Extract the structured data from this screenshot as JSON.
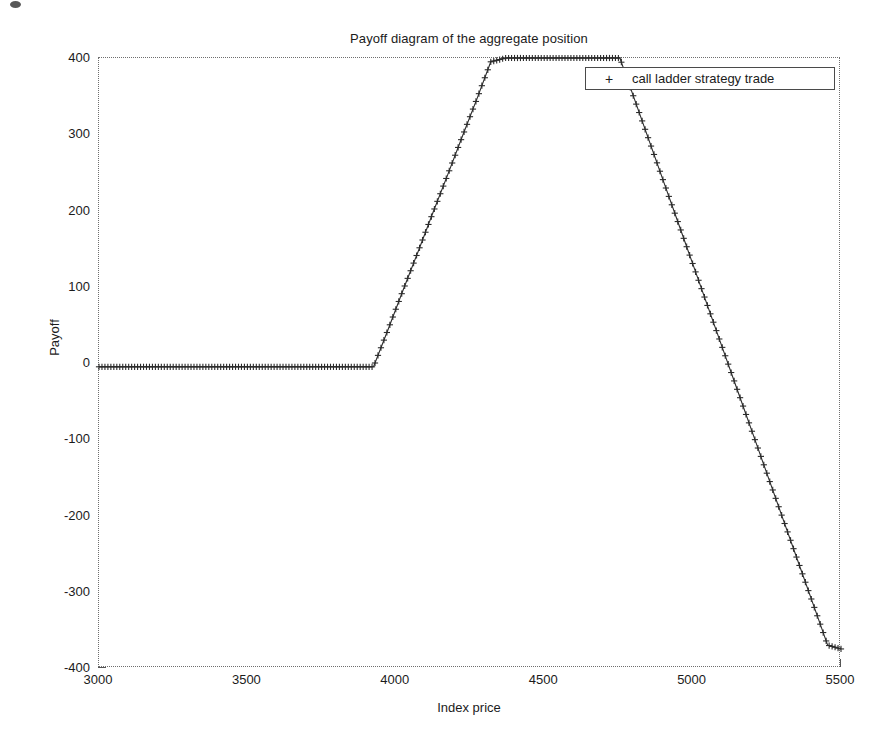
{
  "figure": {
    "title": "Payoff diagram of the aggregate position",
    "background_color": "#ffffff",
    "axis_color": "#6e6e6e",
    "data_color": "#2b2b2b"
  },
  "legend": {
    "marker": "+",
    "label": "call ladder strategy trade",
    "position": "top-right-inside"
  },
  "chart_data": {
    "type": "line",
    "title": "Payoff diagram of the aggregate position",
    "xlabel": "Index price",
    "ylabel": "Payoff",
    "xlim": [
      3000,
      5500
    ],
    "ylim": [
      -400,
      400
    ],
    "xticks": [
      3000,
      3500,
      4000,
      4500,
      5000,
      5500
    ],
    "xtick_labels": [
      "3000",
      "3500",
      "4000",
      "4500",
      "5000",
      "5500"
    ],
    "yticks": [
      -400,
      -300,
      -200,
      -100,
      0,
      100,
      200,
      300,
      400
    ],
    "ytick_labels": [
      "-400",
      "-300",
      "-200",
      "-100",
      "0",
      "100",
      "200",
      "300",
      "400"
    ],
    "grid": false,
    "legend_position": "upper right",
    "marker": "+",
    "linestyle": "-",
    "series": [
      {
        "name": "call ladder strategy trade",
        "color": "#2b2b2b",
        "x": [
          3000,
          3050,
          3100,
          3150,
          3200,
          3250,
          3300,
          3350,
          3400,
          3450,
          3500,
          3550,
          3600,
          3650,
          3700,
          3750,
          3800,
          3850,
          3900,
          3925,
          3975,
          4025,
          4075,
          4125,
          4175,
          4225,
          4275,
          4320,
          4370,
          4420,
          4470,
          4520,
          4570,
          4620,
          4670,
          4720,
          4755,
          4805,
          4855,
          4905,
          4955,
          5005,
          5055,
          5105,
          5155,
          5205,
          5255,
          5305,
          5355,
          5405,
          5455,
          5500
        ],
        "y": [
          -5,
          -5,
          -5,
          -5,
          -5,
          -5,
          -5,
          -5,
          -5,
          -5,
          -5,
          -5,
          -5,
          -5,
          -5,
          -5,
          -5,
          -5,
          -5,
          -5,
          45,
          96,
          146,
          197,
          247,
          298,
          348,
          395,
          400,
          400,
          400,
          400,
          400,
          400,
          400,
          400,
          400,
          345,
          290,
          235,
          180,
          125,
          70,
          15,
          -40,
          -95,
          -150,
          -205,
          -260,
          -315,
          -370,
          -375
        ]
      }
    ],
    "breakpoints": [
      {
        "x": 3925,
        "y": -5,
        "description": "first strike, flat to rising"
      },
      {
        "x": 4320,
        "y": 400,
        "description": "second strike, rising to plateau"
      },
      {
        "x": 4755,
        "y": 400,
        "description": "third strike, plateau to falling"
      }
    ]
  }
}
